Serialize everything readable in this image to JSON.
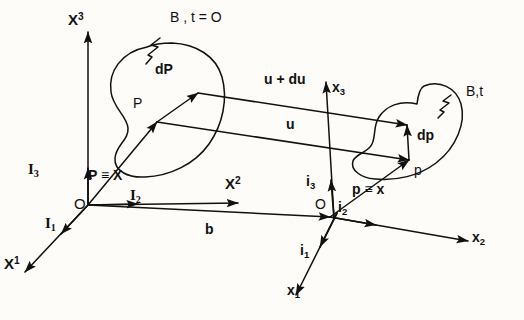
{
  "figure": {
    "background_color": "#fdfcf8",
    "ink_color": "#111111",
    "width": 524,
    "height": 320
  },
  "reference_frame": {
    "origin_label": "O",
    "axes": [
      {
        "name": "axis-x1",
        "base": "X",
        "index": "1",
        "index_kind": "sup"
      },
      {
        "name": "axis-x2",
        "base": "X",
        "index": "2",
        "index_kind": "sup"
      },
      {
        "name": "axis-x3",
        "base": "X",
        "index": "3",
        "index_kind": "sup"
      }
    ],
    "basis_vectors": [
      {
        "name": "basis-I1",
        "base": "I",
        "index": "1"
      },
      {
        "name": "basis-I2",
        "base": "I",
        "index": "2"
      },
      {
        "name": "basis-I3",
        "base": "I",
        "index": "3"
      }
    ]
  },
  "current_frame": {
    "origin_label": "O",
    "axes": [
      {
        "name": "axis-x1-lower",
        "base": "x",
        "index": "1",
        "index_kind": "sub"
      },
      {
        "name": "axis-x2-lower",
        "base": "x",
        "index": "2",
        "index_kind": "sub"
      },
      {
        "name": "axis-x3-lower",
        "base": "x",
        "index": "3",
        "index_kind": "sub"
      }
    ],
    "basis_vectors": [
      {
        "name": "basis-i1",
        "base": "i",
        "index": "1"
      },
      {
        "name": "basis-i2",
        "base": "i",
        "index": "2"
      },
      {
        "name": "basis-i3",
        "base": "i",
        "index": "3"
      }
    ]
  },
  "bodies": {
    "reference": {
      "label": "B , t = O",
      "point_label": "P",
      "line_element_label": "dP",
      "position_vector_label": "P ≡ X"
    },
    "current": {
      "label": "B,t",
      "point_label": "p",
      "line_element_label": "dp",
      "position_vector_label": "p ≡ x"
    }
  },
  "vectors": {
    "displacement": "u",
    "displacement_incremented": "u + du",
    "frame_offset": "b"
  }
}
